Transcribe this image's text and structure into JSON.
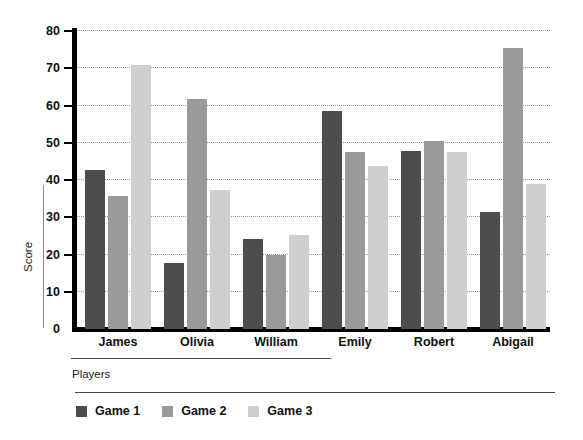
{
  "chart_data": {
    "type": "bar",
    "title": "",
    "subtitle": "",
    "xlabel": "Players",
    "ylabel": "Score",
    "categories": [
      "James",
      "Olivia",
      "William",
      "Emily",
      "Robert",
      "Abigail"
    ],
    "series": [
      {
        "name": "Game 1",
        "color": "#4d4d4d",
        "values": [
          42.7,
          17.7,
          24.2,
          58.5,
          47.8,
          31.5
        ]
      },
      {
        "name": "Game 2",
        "color": "#9a9a9a",
        "values": [
          35.8,
          61.8,
          20.0,
          47.6,
          50.4,
          75.5
        ]
      },
      {
        "name": "Game 3",
        "color": "#cfcfcf",
        "values": [
          71.0,
          37.2,
          25.2,
          43.8,
          47.5,
          38.8
        ]
      }
    ],
    "ylim": [
      0,
      80
    ],
    "yticks": [
      0,
      10,
      20,
      30,
      40,
      50,
      60,
      70,
      80
    ],
    "ytick_labels": [
      "0",
      "10",
      "20",
      "30",
      "40",
      "50",
      "60",
      "70",
      "80"
    ],
    "grid": true,
    "grid_style": "dotted",
    "legend_position": "bottom-left",
    "axis_color": "#000000",
    "background": "#ffffff"
  }
}
